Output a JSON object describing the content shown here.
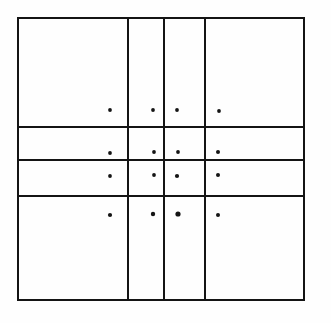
{
  "figure": {
    "background_color": "#fefefe",
    "ink_color": "#141414",
    "canvas": {
      "width": 331,
      "height": 323
    },
    "frame": {
      "label": "outer-rectangle",
      "left": 18,
      "top": 18,
      "right": 304,
      "bottom": 300,
      "stroke_width": 2.4,
      "color": "#141414"
    },
    "vertical_rules": [
      {
        "label": "vertical-rule-1",
        "x": 128,
        "y1": 18,
        "y2": 300,
        "stroke_width": 1.9
      },
      {
        "label": "vertical-rule-2",
        "x": 164,
        "y1": 18,
        "y2": 300,
        "stroke_width": 1.9
      },
      {
        "label": "vertical-rule-3",
        "x": 205,
        "y1": 18,
        "y2": 300,
        "stroke_width": 1.9
      }
    ],
    "horizontal_rules": [
      {
        "label": "horizontal-rule-1",
        "y": 127,
        "x1": 18,
        "x2": 304,
        "stroke_width": 1.9
      },
      {
        "label": "horizontal-rule-2",
        "y": 160,
        "x1": 18,
        "x2": 304,
        "stroke_width": 1.9
      },
      {
        "label": "horizontal-rule-3",
        "y": 196,
        "x1": 18,
        "x2": 304,
        "stroke_width": 1.9
      }
    ],
    "columns": [
      {
        "label": "column-1",
        "x_start": 18,
        "x_end": 128,
        "width": 110
      },
      {
        "label": "column-2",
        "x_start": 128,
        "x_end": 164,
        "width": 36
      },
      {
        "label": "column-3",
        "x_start": 164,
        "x_end": 205,
        "width": 41
      },
      {
        "label": "column-4",
        "x_start": 205,
        "x_end": 304,
        "width": 99
      }
    ],
    "rows": [
      {
        "label": "row-1",
        "y_start": 18,
        "y_end": 127,
        "height": 109
      },
      {
        "label": "row-2",
        "y_start": 127,
        "y_end": 160,
        "height": 33
      },
      {
        "label": "row-3",
        "y_start": 160,
        "y_end": 196,
        "height": 36
      },
      {
        "label": "row-4",
        "y_start": 196,
        "y_end": 300,
        "height": 104
      }
    ],
    "dots": [
      {
        "label": "dot-r1c1",
        "row": 1,
        "col": 1,
        "cx": 110,
        "cy": 110,
        "r": 1.9
      },
      {
        "label": "dot-r1c2",
        "row": 1,
        "col": 2,
        "cx": 153,
        "cy": 110,
        "r": 1.9
      },
      {
        "label": "dot-r1c3",
        "row": 1,
        "col": 3,
        "cx": 177,
        "cy": 110,
        "r": 1.9
      },
      {
        "label": "dot-r1c4",
        "row": 1,
        "col": 4,
        "cx": 219,
        "cy": 111,
        "r": 1.9
      },
      {
        "label": "dot-r2c1",
        "row": 2,
        "col": 1,
        "cx": 110,
        "cy": 153,
        "r": 1.9
      },
      {
        "label": "dot-r2c2",
        "row": 2,
        "col": 2,
        "cx": 154,
        "cy": 152,
        "r": 1.9
      },
      {
        "label": "dot-r2c3",
        "row": 2,
        "col": 3,
        "cx": 178,
        "cy": 152,
        "r": 1.9
      },
      {
        "label": "dot-r2c4",
        "row": 2,
        "col": 4,
        "cx": 218,
        "cy": 152,
        "r": 2.0
      },
      {
        "label": "dot-r3c1",
        "row": 3,
        "col": 1,
        "cx": 110,
        "cy": 176,
        "r": 1.9
      },
      {
        "label": "dot-r3c2",
        "row": 3,
        "col": 2,
        "cx": 154,
        "cy": 175,
        "r": 1.9
      },
      {
        "label": "dot-r3c3",
        "row": 3,
        "col": 3,
        "cx": 177,
        "cy": 176,
        "r": 2.1
      },
      {
        "label": "dot-r3c4",
        "row": 3,
        "col": 4,
        "cx": 218,
        "cy": 175,
        "r": 2.0
      },
      {
        "label": "dot-r4c1",
        "row": 4,
        "col": 1,
        "cx": 110,
        "cy": 215,
        "r": 2.1
      },
      {
        "label": "dot-r4c2",
        "row": 4,
        "col": 2,
        "cx": 153,
        "cy": 214,
        "r": 2.2
      },
      {
        "label": "dot-r4c3",
        "row": 4,
        "col": 3,
        "cx": 178,
        "cy": 214,
        "r": 2.6
      },
      {
        "label": "dot-r4c4",
        "row": 4,
        "col": 4,
        "cx": 218,
        "cy": 215,
        "r": 2.0
      }
    ],
    "counts": {
      "vertical_rules": 3,
      "horizontal_rules": 3,
      "cells": 16,
      "dots": 16
    }
  }
}
